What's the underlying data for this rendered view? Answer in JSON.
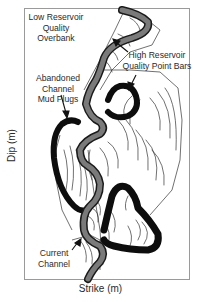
{
  "diagram": {
    "type": "meandering river channel map",
    "axes": {
      "x_label": "Strike (m)",
      "y_label": "Dip (m)"
    },
    "annotations": [
      {
        "id": "overbank",
        "lines": [
          "Low Reservoir",
          "Quality",
          "Overbank"
        ]
      },
      {
        "id": "point-bars",
        "lines": [
          "High Reservoir",
          "Quality Point Bars"
        ]
      },
      {
        "id": "mud-plugs",
        "lines": [
          "Abandoned",
          "Channel",
          "Mud Plugs"
        ]
      },
      {
        "id": "current-channel",
        "lines": [
          "Current",
          "Channel"
        ]
      }
    ],
    "colors": {
      "frame": "#9a9a9a",
      "current_channel": "#7a7a7a",
      "channel_outline": "#1a1a1a",
      "mud_plug": "#0d0d0d",
      "scroll_bars": "#333333"
    }
  }
}
